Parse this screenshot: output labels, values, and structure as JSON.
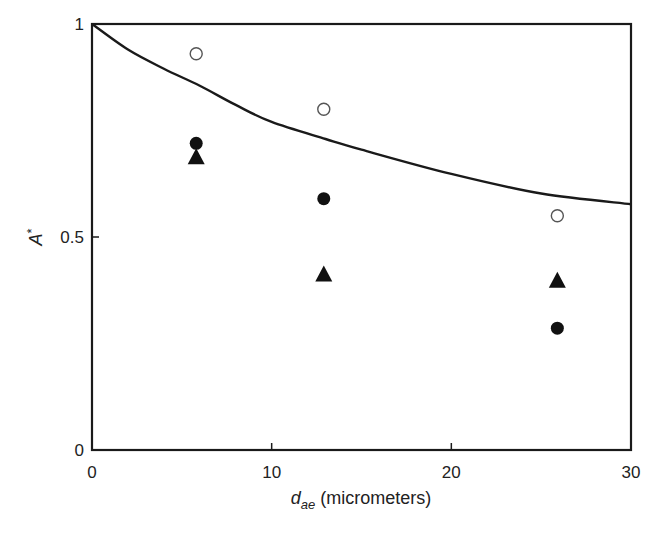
{
  "chart_data": {
    "type": "scatter",
    "title": "",
    "xlabel": "d_ae (micrometers)",
    "xlabel_main": "d",
    "xlabel_sub": "ae",
    "xlabel_rest": " (micrometers)",
    "ylabel": "A*",
    "ylabel_main": "A",
    "ylabel_sup": "*",
    "xlim": [
      0,
      30
    ],
    "ylim": [
      0,
      1
    ],
    "xticks": [
      0,
      10,
      20,
      30
    ],
    "xtick_labels": [
      "0",
      "10",
      "20",
      "30"
    ],
    "yticks": [
      0,
      0.5,
      1
    ],
    "ytick_labels": [
      "0",
      "0.5",
      "1"
    ],
    "grid": false,
    "legend": null,
    "series": [
      {
        "name": "curve",
        "kind": "line",
        "color": "#1a1a1a",
        "x": [
          0,
          2,
          4,
          6,
          8,
          10,
          13,
          15,
          20,
          25,
          30
        ],
        "y": [
          1.0,
          0.94,
          0.895,
          0.855,
          0.81,
          0.77,
          0.73,
          0.705,
          0.648,
          0.602,
          0.577
        ]
      },
      {
        "name": "open-circles",
        "kind": "marker",
        "marker": "open-circle",
        "color": "#555555",
        "x": [
          5.8,
          12.9,
          25.9
        ],
        "y": [
          0.93,
          0.8,
          0.55
        ]
      },
      {
        "name": "filled-circles",
        "kind": "marker",
        "marker": "filled-circle",
        "color": "#111111",
        "x": [
          5.8,
          12.9,
          25.9
        ],
        "y": [
          0.72,
          0.59,
          0.286
        ]
      },
      {
        "name": "filled-triangles",
        "kind": "marker",
        "marker": "filled-triangle",
        "color": "#111111",
        "x": [
          5.8,
          12.9,
          25.9
        ],
        "y": [
          0.685,
          0.41,
          0.395
        ]
      }
    ]
  }
}
